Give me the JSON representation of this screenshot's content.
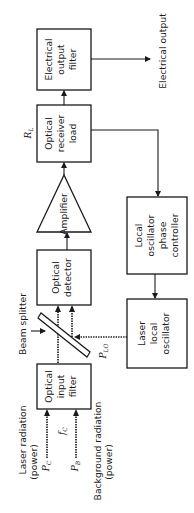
{
  "diagram": {
    "title": "",
    "orientation": "rotated-90-ccw",
    "blocks": {
      "electrical_output_filter": [
        "Electrical",
        "output",
        "filter"
      ],
      "optical_receiver_load": [
        "Optical",
        "receiver",
        "load"
      ],
      "amplifier": "Amplifier",
      "optical_detector": [
        "Optical",
        "detector"
      ],
      "optical_input_filter": [
        "Optical",
        "input",
        "filter"
      ],
      "lo_phase_controller": [
        "Local",
        "oscillator",
        "phase",
        "controller"
      ],
      "laser_local_oscillator": [
        "Laser",
        "local",
        "oscillator"
      ]
    },
    "labels": {
      "electrical_output": "Electrical output",
      "beam_splitter": "Beam splitter",
      "laser_radiation": [
        "Laser radiation",
        "(power)"
      ],
      "background_radiation": [
        "Background radiation",
        "(power)"
      ],
      "rl": {
        "main": "R",
        "sub": "L"
      },
      "pc": {
        "main": "P",
        "sub": "C"
      },
      "fc": {
        "main": "f",
        "sub": "C"
      },
      "pb": {
        "main": "P",
        "sub": "B"
      },
      "plo": {
        "main": "P",
        "sub": "LO"
      }
    },
    "connections": [
      {
        "from": "Laser radiation (power)",
        "to": "Optical input filter",
        "style": "optical"
      },
      {
        "from": "Background radiation (power)",
        "to": "Optical input filter",
        "style": "optical"
      },
      {
        "from": "Optical input filter",
        "to": "Optical detector",
        "via": "Beam splitter",
        "style": "optical"
      },
      {
        "from": "Laser local oscillator",
        "to": "Beam splitter",
        "style": "optical"
      },
      {
        "from": "Beam splitter",
        "to": "Optical detector",
        "style": "optical"
      },
      {
        "from": "Optical detector",
        "to": "Amplifier",
        "style": "electrical"
      },
      {
        "from": "Amplifier",
        "to": "Optical receiver load",
        "style": "electrical"
      },
      {
        "from": "Optical receiver load",
        "to": "Electrical output filter",
        "style": "electrical"
      },
      {
        "from": "Electrical output filter",
        "to": "Electrical output",
        "style": "electrical"
      },
      {
        "from": "Optical receiver load",
        "to": "Local oscillator phase controller",
        "style": "electrical"
      },
      {
        "from": "Local oscillator phase controller",
        "to": "Laser local oscillator",
        "style": "electrical"
      }
    ]
  }
}
